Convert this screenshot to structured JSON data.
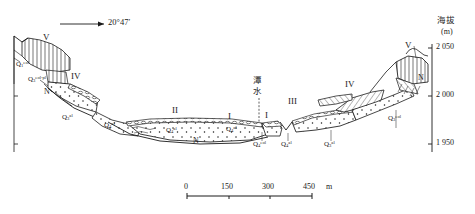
{
  "figure": {
    "type": "geological-cross-section",
    "bearing_label": "20°47′",
    "river_name_cjk": "潭\n水",
    "river_name_line1": "潭",
    "river_name_line2": "水"
  },
  "axis": {
    "title_cjk": "海拔",
    "unit": "(m)",
    "ticks": [
      "2 050",
      "2 000",
      "1 950"
    ],
    "tick_values": [
      2050,
      2000,
      1950
    ],
    "range": [
      1930,
      2060
    ]
  },
  "scalebar": {
    "labels": [
      "0",
      "150",
      "300",
      "450"
    ],
    "unit": "m",
    "values": [
      0,
      150,
      300,
      450
    ]
  },
  "terraces": {
    "left": [
      {
        "name": "V",
        "roman": "V"
      },
      {
        "name": "IV",
        "roman": "IV"
      },
      {
        "name": "II",
        "roman": "II"
      },
      {
        "name": "I",
        "roman": "I"
      }
    ],
    "right": [
      {
        "name": "I",
        "roman": "I"
      },
      {
        "name": "III",
        "roman": "III"
      },
      {
        "name": "IV",
        "roman": "IV"
      },
      {
        "name": "V",
        "roman": "V"
      }
    ]
  },
  "units": {
    "bedrock_symbol": "N",
    "quaternary": [
      {
        "id": "q1-eol-left",
        "base": "Q",
        "sub": "1",
        "sup": "eol"
      },
      {
        "id": "q3-eol-pl",
        "base": "Q",
        "sub": "3",
        "sup": "eol-pl"
      },
      {
        "id": "q3-al-left",
        "base": "Q",
        "sub": "3",
        "sup": "al"
      },
      {
        "id": "q4-al-left",
        "base": "Q",
        "sub": "4",
        "sup": "al"
      },
      {
        "id": "q4-al-mid",
        "base": "Q",
        "sub": "4",
        "sup": "al"
      },
      {
        "id": "q4-al-mid2",
        "base": "Q",
        "sub": "4",
        "sup": "al"
      },
      {
        "id": "q4-eol-c",
        "base": "Q",
        "sub": "4",
        "sup": "eol"
      },
      {
        "id": "q4-al-c2",
        "base": "Q",
        "sub": "4",
        "sup": "al"
      },
      {
        "id": "q3-al-right",
        "base": "Q",
        "sub": "3",
        "sup": "al"
      },
      {
        "id": "q3-eol-right",
        "base": "Q",
        "sub": "3",
        "sup": "eol"
      }
    ]
  },
  "colors": {
    "ink": "#1a1a1a",
    "background": "#ffffff"
  }
}
